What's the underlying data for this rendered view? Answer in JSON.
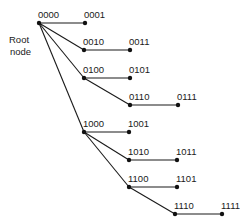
{
  "diagram": {
    "type": "binomial-tree",
    "root_label_line1": "Root",
    "root_label_line2": "node",
    "colors": {
      "ink": "#1a1a1a",
      "background": "#ffffff"
    },
    "nodes": [
      {
        "id": "0000",
        "label": "0000",
        "x": 39,
        "y": 23
      },
      {
        "id": "0001",
        "label": "0001",
        "x": 85,
        "y": 23
      },
      {
        "id": "0010",
        "label": "0010",
        "x": 84,
        "y": 50
      },
      {
        "id": "0011",
        "label": "0011",
        "x": 130,
        "y": 50
      },
      {
        "id": "0100",
        "label": "0100",
        "x": 84,
        "y": 78
      },
      {
        "id": "0101",
        "label": "0101",
        "x": 130,
        "y": 78
      },
      {
        "id": "0110",
        "label": "0110",
        "x": 130,
        "y": 105
      },
      {
        "id": "0111",
        "label": "0111",
        "x": 178,
        "y": 105
      },
      {
        "id": "1000",
        "label": "1000",
        "x": 84,
        "y": 132
      },
      {
        "id": "1001",
        "label": "1001",
        "x": 129,
        "y": 132
      },
      {
        "id": "1010",
        "label": "1010",
        "x": 129,
        "y": 160
      },
      {
        "id": "1011",
        "label": "1011",
        "x": 177,
        "y": 160
      },
      {
        "id": "1100",
        "label": "1100",
        "x": 129,
        "y": 187
      },
      {
        "id": "1101",
        "label": "1101",
        "x": 177,
        "y": 187
      },
      {
        "id": "1110",
        "label": "1110",
        "x": 175,
        "y": 214
      },
      {
        "id": "1111",
        "label": "1111",
        "x": 222,
        "y": 214
      }
    ],
    "edges": [
      [
        "0000",
        "0001"
      ],
      [
        "0000",
        "0010"
      ],
      [
        "0000",
        "0100"
      ],
      [
        "0000",
        "1000"
      ],
      [
        "0010",
        "0011"
      ],
      [
        "0100",
        "0101"
      ],
      [
        "0100",
        "0110"
      ],
      [
        "0110",
        "0111"
      ],
      [
        "1000",
        "1001"
      ],
      [
        "1000",
        "1010"
      ],
      [
        "1000",
        "1100"
      ],
      [
        "1010",
        "1011"
      ],
      [
        "1100",
        "1101"
      ],
      [
        "1100",
        "1110"
      ],
      [
        "1110",
        "1111"
      ]
    ]
  }
}
